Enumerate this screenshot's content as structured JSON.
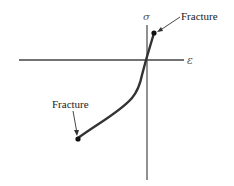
{
  "diagram": {
    "axes": {
      "x_label": "ε",
      "y_label": "σ"
    },
    "annotations": {
      "top_fracture": "Fracture",
      "bottom_fracture": "Fracture"
    },
    "colors": {
      "curve": "#333333",
      "axis": "#444444",
      "point": "#111111"
    }
  }
}
